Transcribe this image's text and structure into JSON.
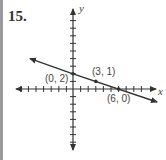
{
  "problem": {
    "number": "15."
  },
  "graph": {
    "axis_labels": {
      "x": "x",
      "y": "y"
    },
    "points": [
      {
        "label": "(0, 2)",
        "x": 0,
        "y": 2
      },
      {
        "label": "(3, 1)",
        "x": 3,
        "y": 1
      },
      {
        "label": "(6, 0)",
        "x": 6,
        "y": 0
      }
    ],
    "line": {
      "description": "Line through (0, 2), (3, 1), (6, 0)",
      "slope": "-1/3",
      "y_intercept": 2
    },
    "colors": {
      "ink": "#333333",
      "border": "#9a9a9a"
    }
  }
}
